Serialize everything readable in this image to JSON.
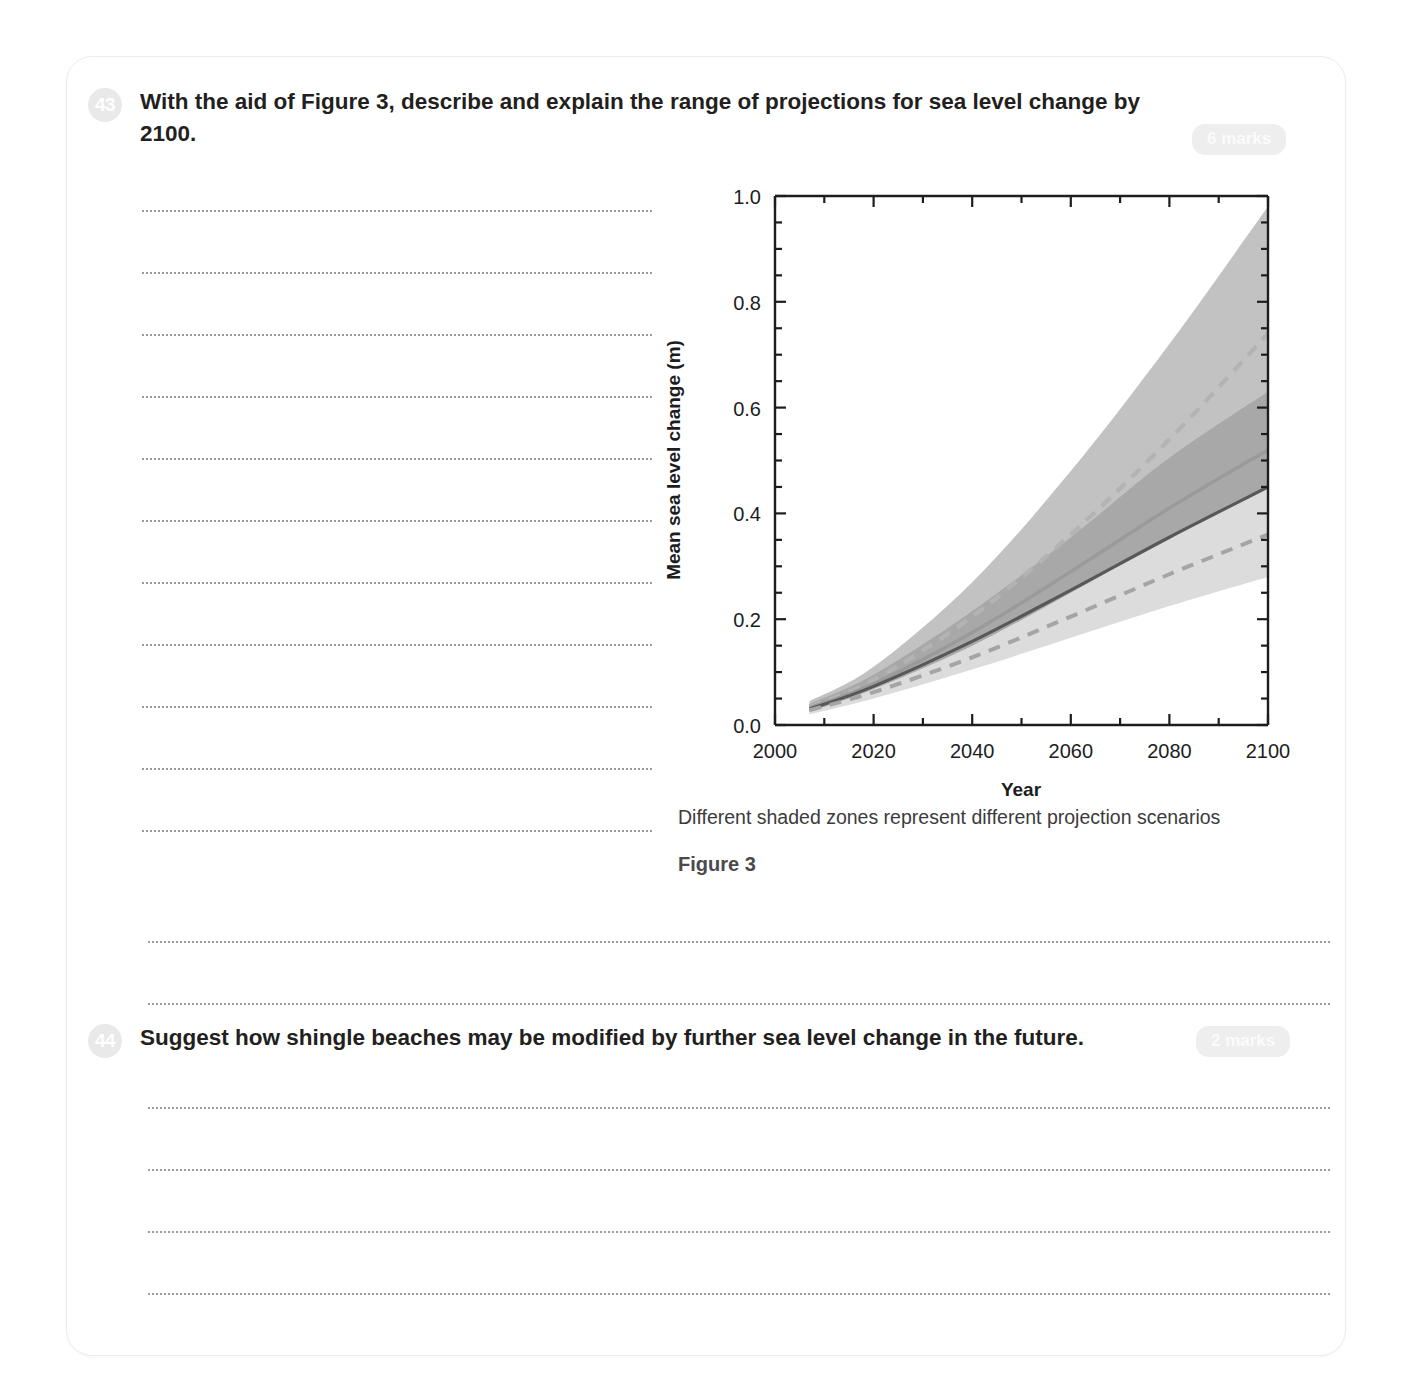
{
  "page": {
    "background": "#ffffff",
    "card_border": "#ececed"
  },
  "questions": [
    {
      "number": "43",
      "text": "With the aid of Figure 3, describe and explain the range of projections for sea level change by 2100.",
      "marks": "6 marks",
      "answer_lines": 13
    },
    {
      "number": "44",
      "text": "Suggest how shingle beaches may be modified by further sea level change in the future.",
      "marks": "2 marks",
      "answer_lines": 4
    }
  ],
  "figure": {
    "caption": "Different shaded zones represent different projection scenarios",
    "label": "Figure 3"
  },
  "chart_data": {
    "type": "area",
    "title": "",
    "xlabel": "Year",
    "ylabel": "Mean sea level change (m)",
    "xlim": [
      2000,
      2100
    ],
    "ylim": [
      0.0,
      1.0
    ],
    "xticks": [
      2000,
      2020,
      2040,
      2060,
      2080,
      2100
    ],
    "xtick_labels": [
      "2000",
      "2020",
      "2040",
      "2060",
      "2080",
      "2100"
    ],
    "xminor_step": 10,
    "yticks": [
      0.0,
      0.2,
      0.4,
      0.6,
      0.8,
      1.0
    ],
    "ytick_labels": [
      "0.0",
      "0.2",
      "0.4",
      "0.6",
      "0.8",
      "1.0"
    ],
    "yminor_step": 0.05,
    "grid": false,
    "legend": "none",
    "x": [
      2007,
      2020,
      2040,
      2060,
      2080,
      2100
    ],
    "bands": [
      {
        "name": "high-scenario-range",
        "color": "#c2c2c2",
        "upper": [
          0.045,
          0.11,
          0.27,
          0.48,
          0.72,
          0.98
        ],
        "lower": [
          0.025,
          0.07,
          0.155,
          0.26,
          0.38,
          0.52
        ]
      },
      {
        "name": "overlap-range",
        "color": "#a8a8a8",
        "upper": [
          0.04,
          0.095,
          0.215,
          0.355,
          0.505,
          0.63
        ],
        "lower": [
          0.025,
          0.068,
          0.15,
          0.25,
          0.355,
          0.45
        ]
      },
      {
        "name": "low-scenario-range",
        "color": "#dcdcdc",
        "upper": [
          0.04,
          0.095,
          0.215,
          0.345,
          0.475,
          0.6
        ],
        "lower": [
          0.02,
          0.05,
          0.105,
          0.165,
          0.225,
          0.28
        ]
      }
    ],
    "series": [
      {
        "name": "high-scenario-mean",
        "style": "dashed",
        "color": "#b3b3b3",
        "width": 4.2,
        "values": [
          0.035,
          0.085,
          0.205,
          0.36,
          0.54,
          0.74
        ]
      },
      {
        "name": "mid-scenario-mean",
        "style": "solid",
        "color": "#9a9a9a",
        "width": 3.4,
        "values": [
          0.032,
          0.078,
          0.175,
          0.29,
          0.41,
          0.52
        ]
      },
      {
        "name": "low-scenario-mean",
        "style": "solid",
        "color": "#58585a",
        "width": 3.2,
        "values": [
          0.03,
          0.073,
          0.158,
          0.255,
          0.355,
          0.45
        ]
      },
      {
        "name": "lowest-scenario-mean",
        "style": "dashed",
        "color": "#a5a5a5",
        "width": 4.0,
        "values": [
          0.028,
          0.062,
          0.128,
          0.205,
          0.285,
          0.36
        ]
      }
    ]
  }
}
